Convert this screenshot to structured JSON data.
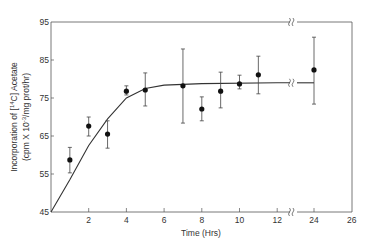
{
  "chart_data": {
    "type": "scatter",
    "title": "",
    "xlabel": "Time (Hrs)",
    "ylabel_line1": "Incorporation of [14C] Acetate",
    "ylabel_line2": "(cpm X 10-3/mg prot/hr)",
    "xlim": [
      0,
      26
    ],
    "ylim": [
      45,
      95
    ],
    "axis_break": "between 12 and 24 hrs",
    "x_ticks": [
      2,
      4,
      6,
      8,
      10,
      12,
      24,
      26
    ],
    "y_ticks": [
      45,
      55,
      65,
      75,
      85,
      95
    ],
    "grid": false,
    "series": [
      {
        "name": "Incorporation",
        "points": [
          {
            "x": 1,
            "y": 58.7,
            "err_low": 55.3,
            "err_high": 62.0
          },
          {
            "x": 2,
            "y": 67.6,
            "err_low": 65.0,
            "err_high": 70.0
          },
          {
            "x": 3,
            "y": 65.5,
            "err_low": 61.8,
            "err_high": 69.0
          },
          {
            "x": 4,
            "y": 76.8,
            "err_low": 75.8,
            "err_high": 78.2
          },
          {
            "x": 5,
            "y": 77.1,
            "err_low": 72.9,
            "err_high": 81.6
          },
          {
            "x": 7,
            "y": 78.2,
            "err_low": 68.4,
            "err_high": 87.9
          },
          {
            "x": 8,
            "y": 72.1,
            "err_low": 69.0,
            "err_high": 75.3
          },
          {
            "x": 9,
            "y": 76.8,
            "err_low": 72.4,
            "err_high": 81.8
          },
          {
            "x": 10,
            "y": 78.7,
            "err_low": 77.4,
            "err_high": 81.0
          },
          {
            "x": 11,
            "y": 81.1,
            "err_low": 76.1,
            "err_high": 86.0
          },
          {
            "x": 24,
            "y": 82.4,
            "err_low": 73.4,
            "err_high": 91.0
          }
        ]
      }
    ],
    "fit_curve": {
      "description": "saturating curve from (0,45) to plateau ~79",
      "points": [
        [
          0,
          45
        ],
        [
          1,
          53.5
        ],
        [
          2,
          62.5
        ],
        [
          3,
          69.5
        ],
        [
          4,
          75
        ],
        [
          5,
          77.5
        ],
        [
          6,
          78.4
        ],
        [
          8,
          78.8
        ],
        [
          12,
          79
        ],
        [
          24,
          79
        ]
      ]
    }
  }
}
